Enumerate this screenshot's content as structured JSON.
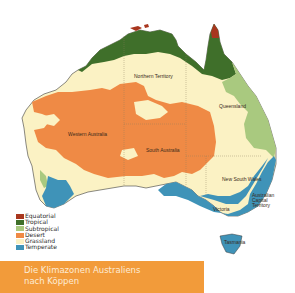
{
  "map": {
    "regions": [
      {
        "id": "nt",
        "label": "Northern Territory"
      },
      {
        "id": "qld",
        "label": "Queensland"
      },
      {
        "id": "wa",
        "label": "Western Australia"
      },
      {
        "id": "sa",
        "label": "South Australia"
      },
      {
        "id": "nsw",
        "label": "New South Wales"
      },
      {
        "id": "act",
        "label": "Australian Capital Territory"
      },
      {
        "id": "vic",
        "label": "Victoria"
      },
      {
        "id": "tas",
        "label": "Tasmania"
      }
    ],
    "colors": {
      "equatorial": "#a8361e",
      "tropical": "#3f6f2a",
      "subtropical": "#a9c97f",
      "desert": "#ef8a45",
      "grassland": "#fbf2c4",
      "temperate": "#3f93b8",
      "border": "#3a3a3a"
    }
  },
  "legend": {
    "items": [
      {
        "label": "Equatorial",
        "color": "#a8361e"
      },
      {
        "label": "Tropical",
        "color": "#3f6f2a"
      },
      {
        "label": "Subtropical",
        "color": "#a9c97f"
      },
      {
        "label": "Desert",
        "color": "#ef8a45"
      },
      {
        "label": "Grassland",
        "color": "#fbf2c4"
      },
      {
        "label": "Temperate",
        "color": "#3f93b8"
      }
    ]
  },
  "caption": {
    "line1": "Die Klimazonen Australiens",
    "line2": "nach Köppen",
    "background": "#f29b3a"
  }
}
